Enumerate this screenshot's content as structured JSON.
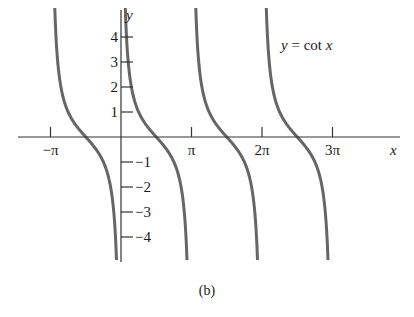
{
  "chart_data": {
    "type": "line",
    "title": "y = cot x",
    "function": "cot",
    "xlabel": "x",
    "ylabel": "y",
    "caption": "(b)",
    "x_ticks": [
      {
        "value": -3.14159,
        "label": "−π"
      },
      {
        "value": 3.14159,
        "label": "π"
      },
      {
        "value": 6.28319,
        "label": "2π"
      },
      {
        "value": 9.42478,
        "label": "3π"
      }
    ],
    "y_ticks": [
      {
        "value": 4,
        "label": "4"
      },
      {
        "value": 3,
        "label": "3"
      },
      {
        "value": 2,
        "label": "2"
      },
      {
        "value": 1,
        "label": "1"
      },
      {
        "value": -1,
        "label": "−1"
      },
      {
        "value": -2,
        "label": "−2"
      },
      {
        "value": -3,
        "label": "−3"
      },
      {
        "value": -4,
        "label": "−4"
      }
    ],
    "branches": [
      {
        "from": -3.14159,
        "to": 0
      },
      {
        "from": 0,
        "to": 3.14159
      },
      {
        "from": 3.14159,
        "to": 6.28319
      },
      {
        "from": 6.28319,
        "to": 9.42478
      }
    ],
    "xlim": [
      -4.1,
      11.5
    ],
    "ylim": [
      -5,
      5.1
    ],
    "grid": false,
    "legend": "none",
    "curve_color": "#666666",
    "axis_color": "#333333"
  },
  "layout": {
    "origin_px": [
      121,
      137
    ],
    "px_per_pi": 70.5,
    "px_per_unit_y": 25,
    "curve_top_px": 8,
    "curve_bottom_px": 260
  }
}
